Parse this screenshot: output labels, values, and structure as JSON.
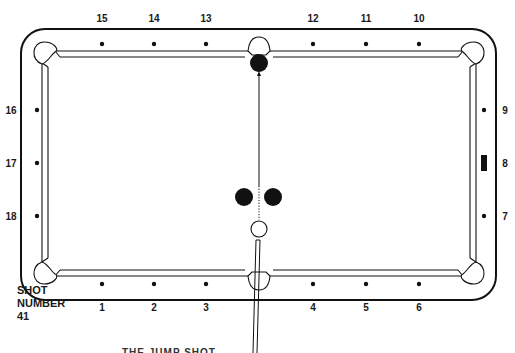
{
  "diagram": {
    "type": "pool-table-shot-diagram",
    "colors": {
      "ink": "#111111",
      "background": "#ffffff",
      "object_ball": "#111111",
      "cue_ball": "#ffffff"
    },
    "diamond_labels": {
      "bottom": [
        "1",
        "2",
        "3",
        "4",
        "5",
        "6"
      ],
      "right": [
        "7",
        "8",
        "9"
      ],
      "top": [
        "10",
        "11",
        "12",
        "13",
        "14",
        "15"
      ],
      "left": [
        "16",
        "17",
        "18"
      ]
    },
    "marked_diamond": "8",
    "balls": [
      {
        "id": "target-ball",
        "color": "black",
        "location": "in front of top side pocket"
      },
      {
        "id": "left-blocker-ball",
        "color": "black",
        "location": "center, left of shot line"
      },
      {
        "id": "right-blocker-ball",
        "color": "black",
        "location": "center, right of shot line"
      },
      {
        "id": "cue-ball",
        "color": "white",
        "location": "below blockers, on shot line"
      }
    ],
    "shot_path": {
      "style": "dotted between blockers, solid to target",
      "direction": "straight up to top side pocket"
    },
    "caption": {
      "line1": "SHOT",
      "line2": "NUMBER",
      "line3": "41"
    },
    "clipped_title": "THE JUMP SHOT"
  }
}
